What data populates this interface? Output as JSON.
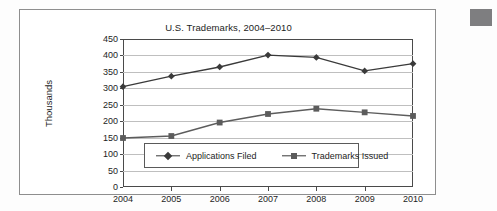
{
  "figure": {
    "corner_swatch_color": "#7e7e80",
    "frame_color": "#8e8e8e"
  },
  "legend": {
    "position": "inside-lower-left",
    "entries": [
      {
        "label": "Applications Filed",
        "marker": "diamond-marker-icon",
        "color": "#3a3a3a"
      },
      {
        "label": "Trademarks Issued",
        "marker": "square-marker-icon",
        "color": "#5c5c5c"
      }
    ]
  },
  "chart_data": {
    "type": "line",
    "title": "U.S. Trademarks, 2004–2010",
    "xlabel": "",
    "ylabel": "Thousands",
    "categories": [
      "2004",
      "2005",
      "2006",
      "2007",
      "2008",
      "2009",
      "2010"
    ],
    "x": [
      2004,
      2005,
      2006,
      2007,
      2008,
      2009,
      2010
    ],
    "ylim": [
      0,
      450
    ],
    "ytick_step": 50,
    "yticks": [
      "450",
      "400",
      "350",
      "300",
      "250",
      "200",
      "150",
      "100",
      "50",
      "0"
    ],
    "ytick_values": [
      450,
      400,
      350,
      300,
      250,
      200,
      150,
      100,
      50,
      0
    ],
    "grid": true,
    "grid_axis": "y",
    "legend_position": "inside-lower-left",
    "series": [
      {
        "name": "Applications Filed",
        "marker": "diamond",
        "color": "#3a3a3a",
        "values": [
          305,
          337,
          365,
          401,
          394,
          353,
          375
        ]
      },
      {
        "name": "Trademarks Issued",
        "marker": "square",
        "color": "#5c5c5c",
        "values": [
          149,
          155,
          196,
          222,
          238,
          227,
          216
        ]
      }
    ]
  }
}
